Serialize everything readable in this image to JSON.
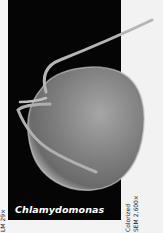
{
  "figure": {
    "organism_label": "Chlamydomonas",
    "left_caption": "LM 29×",
    "right_caption_line1": "Colorized",
    "right_caption_line2": "SEM 2,600×",
    "colors": {
      "panel_background": "#050505",
      "page_background": "#f4f4f4",
      "cell_body": "#8a8a8a",
      "label_text": "#ffffff"
    }
  }
}
